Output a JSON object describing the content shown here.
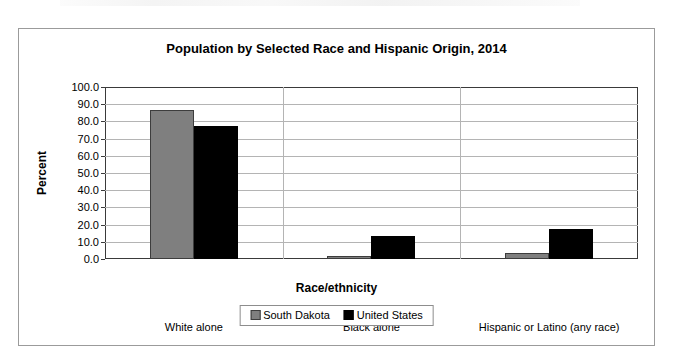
{
  "chart_data": {
    "type": "bar",
    "title": "Population by Selected Race and Hispanic Origin, 2014",
    "xlabel": "Race/ethnicity",
    "ylabel": "Percent",
    "ylim": [
      0,
      100
    ],
    "ytick_labels": [
      "100.0",
      "90.0",
      "80.0",
      "70.0",
      "60.0",
      "50.0",
      "40.0",
      "30.0",
      "20.0",
      "10.0",
      "0.0"
    ],
    "ytick_values": [
      100,
      90,
      80,
      70,
      60,
      50,
      40,
      30,
      20,
      10,
      0
    ],
    "categories": [
      "White alone",
      "Black alone",
      "Hispanic or Latino (any race)"
    ],
    "series": [
      {
        "name": "South Dakota",
        "color": "#7f7f7f",
        "values": [
          86.5,
          1.9,
          3.4
        ]
      },
      {
        "name": "United States",
        "color": "#000000",
        "values": [
          77.4,
          13.2,
          17.3
        ]
      }
    ],
    "grid": true,
    "legend_position": "bottom"
  },
  "frame": {
    "border_color": "#9b9b9b"
  }
}
